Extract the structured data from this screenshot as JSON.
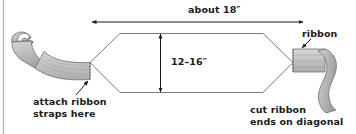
{
  "figure": {
    "background_color": "#ffffff",
    "border_color": "#b6b6b6",
    "line_color": "#4d4d4d",
    "arrow_color": "#1a1a1a",
    "ribbon_fill": "#bdbdbd",
    "ribbon_fill_light": "#d4d4d4",
    "ribbon_fill_dark": "#a3a3a3",
    "ribbon_stroke": "#6e6e6e"
  },
  "dimensions": {
    "width_label": "about 18″",
    "height_label": "12–16″"
  },
  "callouts": {
    "ribbon": {
      "label": "ribbon"
    },
    "attach": {
      "line1": "attach ribbon",
      "line2": "straps here"
    },
    "cut": {
      "line1": "cut ribbon",
      "line2": "ends on diagonal"
    }
  }
}
